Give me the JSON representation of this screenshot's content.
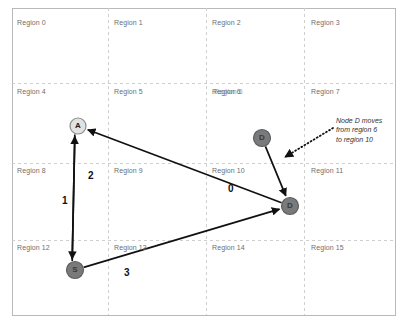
{
  "canvas": {
    "width": 414,
    "height": 328,
    "background": "#ffffff",
    "border_color": "#b9b9b9",
    "grid_color": "#cfcfcf"
  },
  "frame": {
    "x": 12,
    "y": 8,
    "width": 383,
    "height": 307
  },
  "grid": {
    "columns": 4,
    "rows": 4,
    "x_lines": [
      108,
      206,
      304
    ],
    "y_lines": [
      83,
      163,
      240
    ]
  },
  "regions": [
    {
      "id": 0,
      "label": "Region 0",
      "x": 17,
      "y": 19
    },
    {
      "id": 1,
      "label": "Region 1",
      "x": 114,
      "y": 19
    },
    {
      "id": 2,
      "label": "Region 2",
      "x": 212,
      "y": 19
    },
    {
      "id": 3,
      "label": "Region 3",
      "x": 311,
      "y": 19
    },
    {
      "id": 4,
      "label": "Region 4",
      "x": 17,
      "y": 88
    },
    {
      "id": 5,
      "label": "Region 5",
      "x": 114,
      "y": 88
    },
    {
      "id": 6,
      "label": "Region 6",
      "x": 212,
      "y": 88
    },
    {
      "id": 7,
      "label": "Region 7",
      "x": 311,
      "y": 88
    },
    {
      "id": 8,
      "label": "Region 8",
      "x": 17,
      "y": 167
    },
    {
      "id": 9,
      "label": "Region 9",
      "x": 114,
      "y": 167
    },
    {
      "id": 10,
      "label": "Region 10",
      "x": 212,
      "y": 167
    },
    {
      "id": 11,
      "label": "Region 11",
      "x": 311,
      "y": 167
    },
    {
      "id": 12,
      "label": "Region 12",
      "x": 17,
      "y": 244
    },
    {
      "id": 13,
      "label": "Region 13",
      "x": 114,
      "y": 244
    },
    {
      "id": 14,
      "label": "Region 14",
      "x": 212,
      "y": 244
    },
    {
      "id": 15,
      "label": "Region 15",
      "x": 311,
      "y": 244
    }
  ],
  "region_overlap_note": {
    "label": "Region 6",
    "x": 214,
    "y": 88
  },
  "nodes": [
    {
      "id": "A",
      "label": "A",
      "cx": 78,
      "cy": 126,
      "r": 8,
      "fill": "#e2e2e2",
      "stroke": "#8c8c8c",
      "text_color": "#1a1a1a"
    },
    {
      "id": "S",
      "label": "S",
      "cx": 75,
      "cy": 270,
      "r": 8.5,
      "fill": "#7a7a7a",
      "stroke": "#5e5e5e",
      "text_color": "#3a3a3a"
    },
    {
      "id": "D1",
      "label": "D",
      "cx": 262,
      "cy": 138,
      "r": 8.5,
      "fill": "#7a7a7a",
      "stroke": "#5e5e5e",
      "text_color": "#3a3a3a"
    },
    {
      "id": "D2",
      "label": "D",
      "cx": 290,
      "cy": 206,
      "r": 8.5,
      "fill": "#7a7a7a",
      "stroke": "#5e5e5e",
      "text_color": "#3a3a3a"
    }
  ],
  "edges": [
    {
      "id": "e0",
      "label": "0",
      "from": "D2",
      "to": "A",
      "label_x": 228,
      "label_y": 183,
      "style": "solid",
      "color": "#111111"
    },
    {
      "id": "e1",
      "label": "1",
      "from": "S",
      "to": "A",
      "label_x": 62,
      "label_y": 195,
      "style": "solid",
      "color": "#111111"
    },
    {
      "id": "e2",
      "label": "2",
      "from": "A",
      "to": "S",
      "label_x": 88,
      "label_y": 170,
      "style": "solid",
      "color": "#111111"
    },
    {
      "id": "e3",
      "label": "3",
      "from": "S",
      "to": "D2",
      "label_x": 124,
      "label_y": 267,
      "style": "solid",
      "color": "#111111"
    },
    {
      "id": "emove",
      "label": "",
      "from": "D1",
      "to": "D2",
      "style": "solid",
      "color": "#111111"
    }
  ],
  "annotation": {
    "id": "node-d-move-note",
    "lines": [
      "Node D moves",
      "from region 6",
      "to region 10"
    ],
    "x": 336,
    "y": 116,
    "pointer": {
      "style": "dotted",
      "from_x": 333,
      "from_y": 128,
      "to_x": 285,
      "to_y": 157,
      "color": "#111111"
    }
  }
}
